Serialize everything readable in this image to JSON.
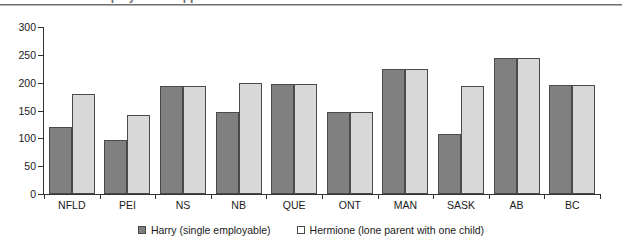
{
  "title": {
    "text": "Employment Support Allowances",
    "cropped": true
  },
  "chart_data": {
    "type": "bar",
    "title": "",
    "xlabel": "",
    "ylabel": "",
    "ylim": [
      0,
      300
    ],
    "yticks": [
      0,
      50,
      100,
      150,
      200,
      250,
      300
    ],
    "grid": false,
    "legend_position": "bottom",
    "categories": [
      "NFLD",
      "PEI",
      "NS",
      "NB",
      "QUE",
      "ONT",
      "MAN",
      "SASK",
      "AB",
      "BC"
    ],
    "series": [
      {
        "name": "Harry (single employable)",
        "color": "#808080",
        "values": [
          120,
          97,
          194,
          148,
          197,
          147,
          225,
          108,
          244,
          196
        ]
      },
      {
        "name": "Hermione (lone parent with one child)",
        "color": "#d8d8d8",
        "values": [
          180,
          142,
          194,
          199,
          197,
          147,
          225,
          194,
          244,
          195
        ]
      }
    ]
  },
  "legend": {
    "entries": [
      {
        "label": "Harry (single employable)",
        "swatch": "filled-dark-square-icon"
      },
      {
        "label": "Hermione (lone parent with one child)",
        "swatch": "open-square-icon"
      }
    ]
  }
}
